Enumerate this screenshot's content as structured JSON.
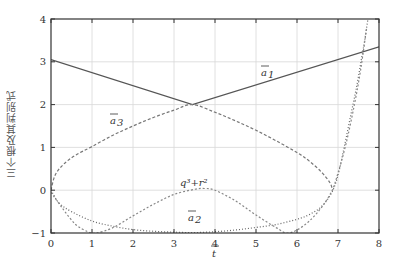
{
  "chart_data": {
    "type": "line",
    "title": "",
    "xlabel": "t̄",
    "ylabel": "三个根及其判别式",
    "xlim": [
      0,
      8
    ],
    "ylim": [
      -1,
      4
    ],
    "xticks": [
      "0",
      "1",
      "2",
      "3",
      "4",
      "5",
      "6",
      "7",
      "8"
    ],
    "yticks": [
      "−1",
      "0",
      "1",
      "2",
      "3",
      "4"
    ],
    "grid": true,
    "legend": "none",
    "annotations": [
      {
        "text": "ā₁",
        "x": 5.0,
        "y": 2.55
      },
      {
        "text": "ā₃",
        "x": 1.4,
        "y": 1.75
      },
      {
        "text": "q³+r²",
        "x": 3.2,
        "y": 0.2
      },
      {
        "text": "ā₂",
        "x": 3.6,
        "y": -0.55
      }
    ],
    "series": [
      {
        "name": "ā₁ (upper root)",
        "style": "solid",
        "color": "#555555",
        "x": [
          0,
          3.45,
          8
        ],
        "y": [
          3.05,
          2.0,
          3.35
        ]
      },
      {
        "name": "ā₃ (upper loop branch)",
        "style": "dashed",
        "color": "#777777",
        "x": [
          0,
          0.1,
          0.3,
          0.6,
          1.0,
          1.5,
          2.0,
          2.5,
          3.0,
          3.45,
          4.0,
          4.5,
          5.0,
          5.5,
          6.0,
          6.3,
          6.6,
          6.8,
          6.87
        ],
        "y": [
          0,
          0.35,
          0.6,
          0.82,
          1.02,
          1.28,
          1.5,
          1.7,
          1.87,
          2.0,
          1.82,
          1.62,
          1.4,
          1.15,
          0.88,
          0.68,
          0.42,
          0.18,
          0.0
        ]
      },
      {
        "name": "ā₂ (lower root)",
        "style": "dotted",
        "color": "#666666",
        "x": [
          0,
          0.2,
          0.5,
          1.0,
          1.5,
          2.0,
          2.5,
          3.0,
          3.5,
          4.0,
          4.5,
          5.0,
          5.5,
          6.0,
          6.3,
          6.6,
          6.85,
          7.0,
          7.15,
          7.3,
          7.45,
          7.56,
          7.65,
          7.73
        ],
        "y": [
          0,
          -0.3,
          -0.5,
          -0.72,
          -0.84,
          -0.92,
          -0.96,
          -0.98,
          -0.99,
          -0.97,
          -0.93,
          -0.87,
          -0.8,
          -0.68,
          -0.57,
          -0.38,
          -0.05,
          0.35,
          1.0,
          1.7,
          2.4,
          3.0,
          3.5,
          4.0
        ]
      },
      {
        "name": "q³+r²",
        "style": "dashed-fine",
        "color": "#888888",
        "x": [
          0,
          0.3,
          0.6,
          0.9,
          1.1,
          1.5,
          2.0,
          2.5,
          3.0,
          3.5,
          3.75,
          4.0,
          4.5,
          5.0,
          5.5,
          5.75,
          6.0,
          6.3,
          6.6,
          6.85,
          7.0,
          7.2,
          7.4,
          7.55,
          7.7
        ],
        "y": [
          -0.05,
          -0.45,
          -0.8,
          -0.97,
          -1.0,
          -0.88,
          -0.6,
          -0.33,
          -0.1,
          0.02,
          0.04,
          0.0,
          -0.25,
          -0.58,
          -0.88,
          -1.0,
          -0.93,
          -0.72,
          -0.4,
          -0.02,
          0.4,
          1.1,
          2.0,
          2.8,
          3.8
        ]
      }
    ]
  },
  "axes": {
    "x_axis_label": "t",
    "y_axis_label": "三个根及其判别式"
  },
  "labels": {
    "a1": "a",
    "a1_sub": "1",
    "a3": "a",
    "a3_sub": "3",
    "a2": "a",
    "a2_sub": "2",
    "disc": "q³+r²"
  },
  "colors": {
    "axis": "#333333",
    "grid": "#d8d8d8",
    "curve_solid": "#555555",
    "curve_dashed": "#777777",
    "curve_dotted": "#666666"
  }
}
